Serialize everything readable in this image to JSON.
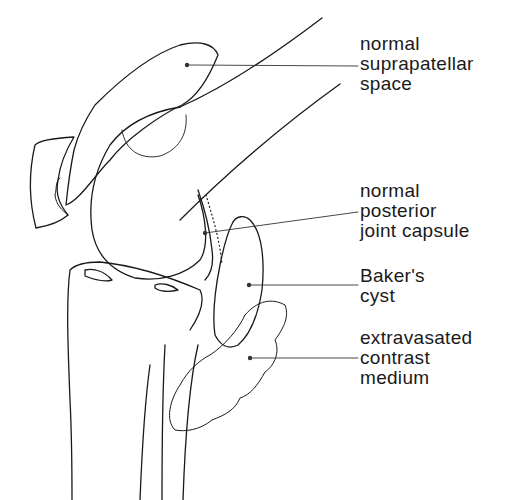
{
  "diagram": {
    "line_color": "#1a1a1a",
    "labels": [
      {
        "id": "suprapatellar",
        "lines": [
          "normal",
          "suprapatellar",
          "space"
        ]
      },
      {
        "id": "posterior-capsule",
        "lines": [
          "normal",
          "posterior",
          "joint capsule"
        ]
      },
      {
        "id": "bakers-cyst",
        "lines": [
          "Baker's",
          "cyst"
        ]
      },
      {
        "id": "extravasated",
        "lines": [
          "extravasated",
          "contrast",
          "medium"
        ]
      }
    ]
  }
}
